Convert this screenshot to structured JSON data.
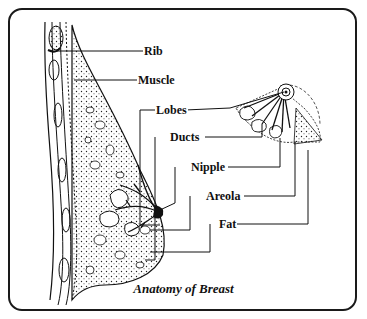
{
  "diagram": {
    "title": "Anatomy of Breast",
    "labels": [
      {
        "id": "rib",
        "text": "Rib"
      },
      {
        "id": "muscle",
        "text": "Muscle"
      },
      {
        "id": "lobes",
        "text": "Lobes"
      },
      {
        "id": "ducts",
        "text": "Ducts"
      },
      {
        "id": "nipple",
        "text": "Nipple"
      },
      {
        "id": "areola",
        "text": "Areola"
      },
      {
        "id": "fat",
        "text": "Fat"
      }
    ],
    "views": [
      "side-cross-section",
      "frontal-quarter-section"
    ],
    "colors": {
      "ink": "#111111",
      "background": "#ffffff"
    }
  }
}
